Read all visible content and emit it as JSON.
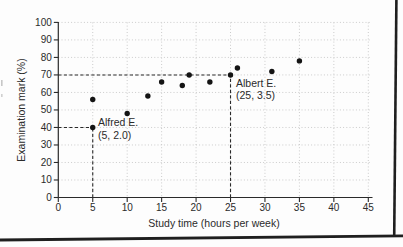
{
  "figure": {
    "frame_color": "#1f1f1f",
    "background": "#fdfdfd"
  },
  "chart_data": {
    "type": "scatter",
    "title": "",
    "xlabel": "Study time (hours per week)",
    "ylabel": "Examination mark (%)",
    "xlim": [
      0,
      45
    ],
    "ylim": [
      0,
      100
    ],
    "xticks": [
      0,
      5,
      10,
      15,
      20,
      25,
      30,
      35,
      40,
      45
    ],
    "yticks": [
      0,
      10,
      20,
      30,
      40,
      50,
      60,
      70,
      80,
      90,
      100
    ],
    "grid": true,
    "grid_style": "dotted",
    "legend": false,
    "points": [
      {
        "x": 5,
        "y": 56
      },
      {
        "x": 5,
        "y": 40
      },
      {
        "x": 10,
        "y": 48
      },
      {
        "x": 13,
        "y": 58
      },
      {
        "x": 15,
        "y": 66
      },
      {
        "x": 18,
        "y": 64
      },
      {
        "x": 19,
        "y": 70
      },
      {
        "x": 22,
        "y": 66
      },
      {
        "x": 25,
        "y": 70
      },
      {
        "x": 26,
        "y": 74
      },
      {
        "x": 31,
        "y": 72
      },
      {
        "x": 35,
        "y": 78
      }
    ],
    "annotations": [
      {
        "name": "Albert E.",
        "coords_label": "(25, 3.5)",
        "label_lines": [
          "Albert E.",
          "(25, 3.5)"
        ],
        "x": 25,
        "y": 70,
        "dashed_guides": true
      },
      {
        "name": "Alfred E.",
        "coords_label": "(5, 2.0)",
        "label_lines": [
          "Alfred E.",
          "(5, 2.0)"
        ],
        "x": 5,
        "y": 40,
        "dashed_guides": true
      }
    ],
    "point_color": "#141414",
    "grid_color": "#cbcbcb",
    "dashed_line_color": "#2a2a2a",
    "axis_color": "#2a2a2a",
    "text_color": "#2b2b2b"
  }
}
